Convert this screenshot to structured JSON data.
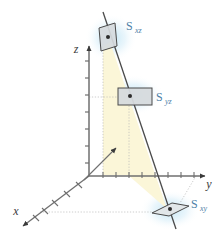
{
  "figure": {
    "background_color": "#ffffff",
    "axes": {
      "x": {
        "label": "x",
        "label_color": "#3a3a3a",
        "tick_count": 5,
        "arrow": true
      },
      "y": {
        "label": "y",
        "label_color": "#3a3a3a",
        "tick_count": 8,
        "arrow": true
      },
      "z": {
        "label": "z",
        "label_color": "#3a3a3a",
        "tick_count": 7,
        "arrow": true
      }
    },
    "surfaces": [
      {
        "id": "s-xz",
        "label": "S",
        "subscript": "xz",
        "label_color": "#4f7fa8",
        "shape": "parallelogram",
        "fill": "#d9dde0",
        "stroke": "#4a4a4a",
        "glow": "#cfe8f5",
        "center_dot": true
      },
      {
        "id": "s-yz",
        "label": "S",
        "subscript": "yz",
        "label_color": "#4f7fa8",
        "shape": "rectangle",
        "fill": "#d9dde0",
        "stroke": "#4a4a4a",
        "glow": "#cfe8f5",
        "center_dot": true
      },
      {
        "id": "s-xy",
        "label": "S",
        "subscript": "xy",
        "label_color": "#4f7fa8",
        "shape": "parallelogram",
        "fill": "#e4e8ea",
        "stroke": "#4a4a4a",
        "glow": "#cfe8f5",
        "center_dot": true
      }
    ],
    "shaded_region": {
      "name": "projection-wedge",
      "fill": "#fbf6d8",
      "description": "pale yellow wedge between the slanted line and its vertical projection"
    },
    "slant_line": {
      "name": "slant-line",
      "color": "#4a4a4a",
      "description": "dark line descending from upper left through all three surface centers"
    },
    "guide_lines": {
      "color": "#b4b4b4",
      "style": "dotted"
    }
  }
}
